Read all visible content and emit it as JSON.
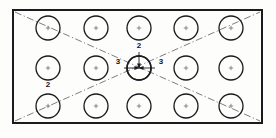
{
  "drawing": {
    "title": "Rectangular plate hole pattern",
    "type": "engineering-drawing",
    "background_color": "#fdfdfc",
    "line_color": "#1a1a1f",
    "centerline_color": "#6e6e75",
    "plate": {
      "name": "outer-plate-rectangle",
      "x": 13,
      "y": 10,
      "width": 249,
      "height": 113,
      "stroke_width": 2.0
    },
    "grid": {
      "columns": 5,
      "rows": 3,
      "hole_count": 15,
      "hole_radius": 12,
      "column_centers": [
        48,
        96,
        139,
        186,
        231
      ],
      "row_centers": [
        28,
        68,
        106
      ],
      "hole_stroke_width": 1.3,
      "center_mark_size": 2.2
    },
    "center_hole": {
      "name": "center-hole-highlighted",
      "cx": 139,
      "cy": 68,
      "r": 12
    },
    "centerlines": [
      {
        "name": "diagonal-centerline-tl-br",
        "x1": 15,
        "y1": 12,
        "x2": 260,
        "y2": 121
      },
      {
        "name": "diagonal-centerline-bl-tr",
        "x1": 15,
        "y1": 121,
        "x2": 260,
        "y2": 12
      }
    ],
    "dimension_labels": [
      {
        "name": "dimension-label-top",
        "text": "2",
        "x": 139,
        "y": 48
      },
      {
        "name": "dimension-label-left",
        "text": "3",
        "x": 118,
        "y": 64
      },
      {
        "name": "dimension-label-right",
        "text": "3",
        "x": 161,
        "y": 64
      },
      {
        "name": "dimension-label-lower-left",
        "text": "2",
        "x": 48,
        "y": 87
      }
    ],
    "dimension_arrows": [
      {
        "name": "arrow-vertical-into-center",
        "x1": 139,
        "y1": 52,
        "x2": 139,
        "y2": 68
      },
      {
        "name": "arrow-left-into-center",
        "x1": 124,
        "y1": 68,
        "x2": 139,
        "y2": 68
      },
      {
        "name": "arrow-right-into-center",
        "x1": 155,
        "y1": 68,
        "x2": 139,
        "y2": 68
      }
    ]
  }
}
